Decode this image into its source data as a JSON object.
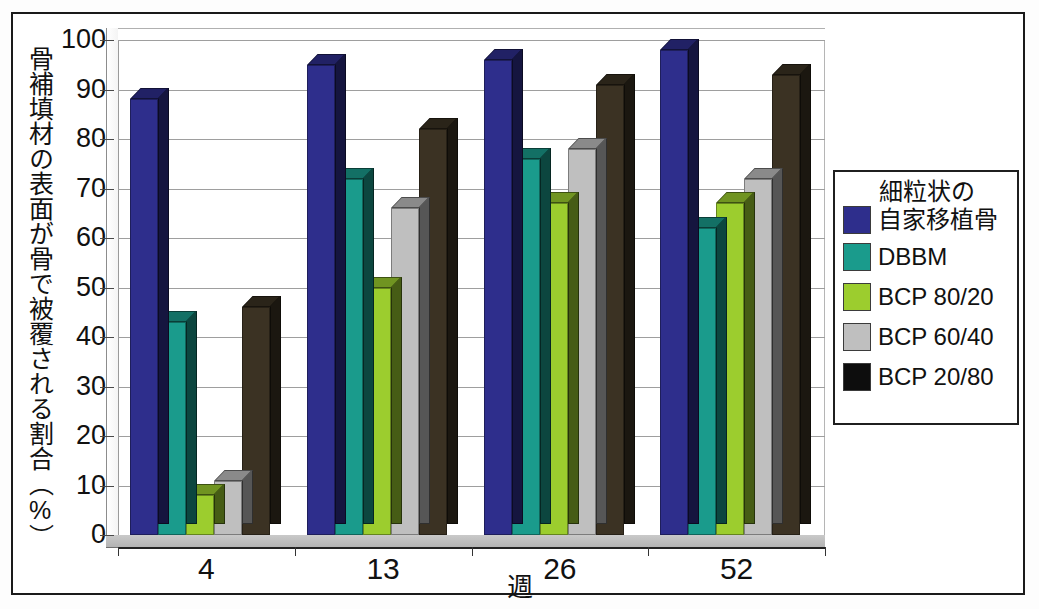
{
  "chart_data": {
    "type": "bar",
    "title": "",
    "xlabel": "週",
    "ylabel": "骨補填材の表面が骨で被覆される割合（%）",
    "categories": [
      "4",
      "13",
      "26",
      "52"
    ],
    "ylim": [
      0,
      100
    ],
    "yticks": [
      0,
      10,
      20,
      30,
      40,
      50,
      60,
      70,
      80,
      90,
      100
    ],
    "grid": true,
    "legend_position": "right",
    "legend_title": "細粒状の\n自家移植骨",
    "series": [
      {
        "name": "細粒状の自家移植骨",
        "color": "#2e2e8c",
        "values": [
          88,
          95,
          96,
          98
        ]
      },
      {
        "name": "DBBM",
        "color": "#1a9b8c",
        "values": [
          43,
          72,
          76,
          62
        ]
      },
      {
        "name": "BCP 80/20",
        "color": "#9ccd2e",
        "values": [
          8,
          50,
          67,
          67
        ]
      },
      {
        "name": "BCP 60/40",
        "color": "#bfbfbf",
        "values": [
          11,
          66,
          78,
          72
        ]
      },
      {
        "name": "BCP 20/80",
        "color": "#3b3223",
        "values": [
          46,
          82,
          91,
          93
        ]
      }
    ]
  },
  "legend": {
    "title_line1": "細粒状の",
    "title_line2": "自家移植骨",
    "items": [
      {
        "label": "自家移植骨",
        "color": "#2e2e8c"
      },
      {
        "label": "DBBM",
        "color": "#1a9b8c"
      },
      {
        "label": "BCP 80/20",
        "color": "#9ccd2e"
      },
      {
        "label": "BCP 60/40",
        "color": "#bfbfbf"
      },
      {
        "label": "BCP 20/80",
        "color": "#0d0d0d"
      }
    ]
  },
  "axis": {
    "y_label_text": "骨補填材の表面が骨で被覆される割合（%）",
    "x_label_text": "週",
    "y_ticks": [
      "100",
      "90",
      "80",
      "70",
      "60",
      "50",
      "40",
      "30",
      "20",
      "10",
      "0"
    ],
    "x_ticks": [
      "4",
      "13",
      "26",
      "52"
    ]
  }
}
